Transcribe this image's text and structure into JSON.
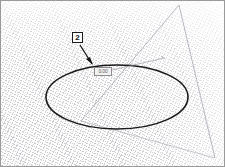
{
  "viewport": {
    "name": "3d-modeling-viewport",
    "background_color": "#fdfdfd",
    "frame_color": "#9a9a9a",
    "grid": {
      "label": "perspective-ground-grid",
      "line_color": "#9696a0",
      "spacing_px": 3,
      "angle_primary_deg": 24,
      "angle_secondary_deg": 117
    }
  },
  "annotations": {
    "callout": {
      "label": "2",
      "box_color": "#1c1c1c",
      "fill_color": "#ffffff"
    },
    "tooltip": {
      "text": "0.00",
      "border_color": "#8e8e8e",
      "fill_color": "#f2f2f2",
      "text_color": "#5a5a5a"
    }
  },
  "geometry": {
    "circle": {
      "label": "circle-sketch-entity",
      "stroke_color": "#1a1a1a",
      "stroke_width": 1.6,
      "center_x": 116,
      "center_y": 96,
      "radius_x": 71,
      "radius_y": 32
    },
    "axis_line": {
      "label": "construction-axis-line",
      "stroke_color": "#9b9baa",
      "stroke_width": 0.7,
      "x1": 178,
      "y1": 4,
      "x2": 214,
      "y2": 157
    },
    "leader_line": {
      "label": "dimension-leader-line",
      "stroke_color": "#8f8f9c",
      "stroke_width": 0.6,
      "x1": 107,
      "y1": 70,
      "x2": 163,
      "y2": 57
    },
    "arrow": {
      "label": "callout-arrow",
      "stroke_color": "#151515",
      "stroke_width": 1.3,
      "x1": 79,
      "y1": 44,
      "x2": 91,
      "y2": 63
    }
  }
}
